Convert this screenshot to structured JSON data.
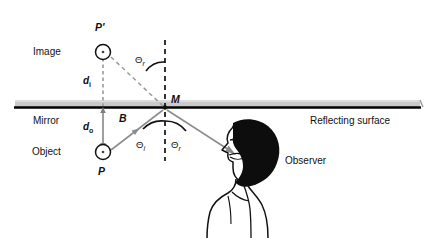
{
  "figure": {
    "panel_id": "a.",
    "topic": "plane-mirror-reflection",
    "labels": {
      "image": "Image",
      "object": "Object",
      "mirror": "Mirror",
      "reflecting_surface": "Reflecting surface",
      "observer": "Observer",
      "point_image": "P'",
      "point_object": "P",
      "point_mirror": "M",
      "normal_segment": "B",
      "distance_image": "d",
      "distance_image_sub": "i",
      "distance_object": "d",
      "distance_object_sub": "o",
      "angle_reflection_upper": "Θ",
      "angle_reflection_upper_sub": "r",
      "angle_incidence": "Θ",
      "angle_incidence_sub": "i",
      "angle_reflection": "Θ",
      "angle_reflection_sub": "r"
    },
    "colors": {
      "ink": "#111111",
      "ray_gray": "#8d8d8d",
      "mirror_band": "#c9c9c9",
      "mirror_line": "#000000",
      "background": "#ffffff"
    },
    "geometry": {
      "mirror_line_y": 107,
      "mirror_band": [
        15,
        100,
        420,
        107
      ],
      "mirror_point_M": [
        165,
        108
      ],
      "image_point": [
        103,
        52
      ],
      "object_point": [
        103,
        152
      ],
      "observer_eye": [
        236,
        155
      ],
      "normal_line_x": 165,
      "normal_top_y": 40,
      "normal_bottom_y": 161
    }
  }
}
